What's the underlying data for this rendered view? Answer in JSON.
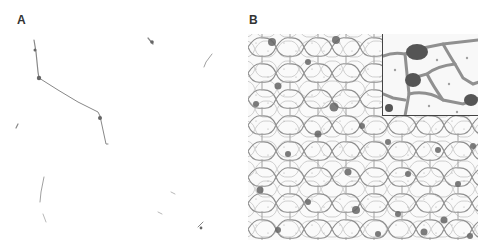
{
  "figure": {
    "panels": [
      {
        "id": "A",
        "label": "A",
        "description": "Sparse thin cell processes on white background"
      },
      {
        "id": "B",
        "label": "B",
        "description": "Dense network of cell outlines with dark stained clusters",
        "inset": "magnified region top-right"
      }
    ]
  },
  "colors": {
    "background": "#ffffff",
    "stain": "#555555",
    "network": "#8a8a8a",
    "inset_border": "#444444"
  }
}
